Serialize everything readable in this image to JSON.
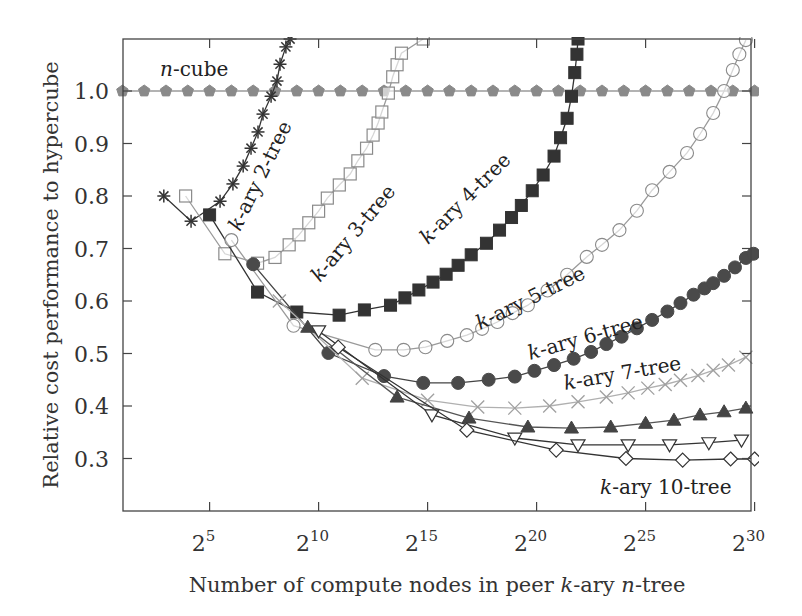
{
  "chart_data": {
    "type": "line",
    "title": "",
    "xlabel": "Number of compute nodes in peer k-ary n-tree",
    "ylabel": "Relative cost performance to hypercube",
    "x_scale": "log2",
    "xlim_log2": [
      1,
      30
    ],
    "ylim": [
      0.2,
      1.1
    ],
    "x_ticks": [
      {
        "exp": 5,
        "label": "2",
        "sup": "5"
      },
      {
        "exp": 10,
        "label": "2",
        "sup": "10"
      },
      {
        "exp": 15,
        "label": "2",
        "sup": "15"
      },
      {
        "exp": 20,
        "label": "2",
        "sup": "20"
      },
      {
        "exp": 25,
        "label": "2",
        "sup": "25"
      },
      {
        "exp": 30,
        "label": "2",
        "sup": "30"
      }
    ],
    "y_ticks": [
      {
        "value": 0.3,
        "label": "0.3"
      },
      {
        "value": 0.4,
        "label": "0.4"
      },
      {
        "value": 0.5,
        "label": "0.5"
      },
      {
        "value": 0.6,
        "label": "0.6"
      },
      {
        "value": 0.7,
        "label": "0.7"
      },
      {
        "value": 0.8,
        "label": "0.8"
      },
      {
        "value": 0.9,
        "label": "0.9"
      },
      {
        "value": 1.0,
        "label": "1.0"
      }
    ],
    "grid": false,
    "legend": "inline labels",
    "series": [
      {
        "name": "n-cube",
        "marker": "pentagon-filled",
        "color": "#8a8a8a",
        "line_color": "#9a9a9a",
        "points": [
          [
            1,
            1.0
          ],
          [
            2,
            1.0
          ],
          [
            3,
            1.0
          ],
          [
            4,
            1.0
          ],
          [
            5,
            1.0
          ],
          [
            6,
            1.0
          ],
          [
            7,
            1.0
          ],
          [
            8,
            1.0
          ],
          [
            9,
            1.0
          ],
          [
            10,
            1.0
          ],
          [
            11,
            1.0
          ],
          [
            12,
            1.0
          ],
          [
            13,
            1.0
          ],
          [
            14,
            1.0
          ],
          [
            15,
            1.0
          ],
          [
            16,
            1.0
          ],
          [
            17,
            1.0
          ],
          [
            18,
            1.0
          ],
          [
            19,
            1.0
          ],
          [
            20,
            1.0
          ],
          [
            21,
            1.0
          ],
          [
            22,
            1.0
          ],
          [
            23,
            1.0
          ],
          [
            24,
            1.0
          ],
          [
            25,
            1.0
          ],
          [
            26,
            1.0
          ],
          [
            27,
            1.0
          ],
          [
            28,
            1.0
          ],
          [
            29,
            1.0
          ],
          [
            30,
            1.0
          ]
        ]
      },
      {
        "name": "k-ary 2-tree",
        "marker": "asterisk",
        "color": "#333333",
        "line_color": "#333333",
        "points": [
          [
            2.9,
            0.8
          ],
          [
            4.15,
            0.752
          ],
          [
            5.48,
            0.79
          ],
          [
            6.07,
            0.823
          ],
          [
            6.54,
            0.857
          ],
          [
            6.9,
            0.891
          ],
          [
            7.22,
            0.922
          ],
          [
            7.45,
            0.956
          ],
          [
            7.82,
            0.99
          ],
          [
            8.09,
            1.019
          ],
          [
            8.23,
            1.051
          ],
          [
            8.5,
            1.084
          ],
          [
            8.69,
            1.099
          ]
        ]
      },
      {
        "name": "k-ary 3-tree",
        "marker": "square-open",
        "color": "#8a8a8a",
        "line_color": "#9a9a9a",
        "points": [
          [
            3.9,
            0.8
          ],
          [
            5.7,
            0.69
          ],
          [
            7.2,
            0.672
          ],
          [
            8.0,
            0.683
          ],
          [
            8.65,
            0.707
          ],
          [
            9.1,
            0.726
          ],
          [
            9.55,
            0.749
          ],
          [
            10.0,
            0.771
          ],
          [
            10.4,
            0.796
          ],
          [
            10.95,
            0.821
          ],
          [
            11.45,
            0.842
          ],
          [
            11.8,
            0.867
          ],
          [
            12.2,
            0.891
          ],
          [
            12.5,
            0.916
          ],
          [
            12.73,
            0.939
          ],
          [
            12.9,
            0.96
          ],
          [
            13.2,
            0.996
          ],
          [
            13.4,
            1.027
          ],
          [
            13.6,
            1.05
          ],
          [
            13.8,
            1.072
          ],
          [
            14.8,
            1.099
          ]
        ]
      },
      {
        "name": "k-ary 4-tree",
        "marker": "square-filled",
        "color": "#333333",
        "line_color": "#333333",
        "points": [
          [
            5.0,
            0.764
          ],
          [
            7.2,
            0.617
          ],
          [
            9.0,
            0.579
          ],
          [
            10.94,
            0.573
          ],
          [
            12.1,
            0.583
          ],
          [
            13.3,
            0.592
          ],
          [
            13.96,
            0.606
          ],
          [
            14.6,
            0.621
          ],
          [
            15.25,
            0.636
          ],
          [
            15.85,
            0.651
          ],
          [
            16.4,
            0.668
          ],
          [
            17.0,
            0.688
          ],
          [
            17.7,
            0.71
          ],
          [
            18.3,
            0.735
          ],
          [
            18.85,
            0.759
          ],
          [
            19.3,
            0.782
          ],
          [
            19.8,
            0.81
          ],
          [
            20.3,
            0.84
          ],
          [
            20.8,
            0.876
          ],
          [
            21.1,
            0.911
          ],
          [
            21.4,
            0.948
          ],
          [
            21.6,
            0.99
          ],
          [
            21.75,
            1.035
          ],
          [
            21.85,
            1.07
          ],
          [
            21.9,
            1.099
          ]
        ]
      },
      {
        "name": "k-ary 5-tree",
        "marker": "circle-open",
        "color": "#8a8a8a",
        "line_color": "#9a9a9a",
        "points": [
          [
            6.0,
            0.716
          ],
          [
            8.85,
            0.553
          ],
          [
            12.6,
            0.507
          ],
          [
            13.9,
            0.507
          ],
          [
            14.9,
            0.512
          ],
          [
            15.9,
            0.524
          ],
          [
            16.8,
            0.535
          ],
          [
            17.5,
            0.547
          ],
          [
            18.2,
            0.56
          ],
          [
            18.9,
            0.577
          ],
          [
            19.6,
            0.592
          ],
          [
            20.5,
            0.62
          ],
          [
            21.4,
            0.65
          ],
          [
            22.3,
            0.684
          ],
          [
            23.0,
            0.707
          ],
          [
            23.8,
            0.735
          ],
          [
            24.6,
            0.772
          ],
          [
            25.3,
            0.811
          ],
          [
            26.1,
            0.846
          ],
          [
            26.9,
            0.882
          ],
          [
            27.5,
            0.918
          ],
          [
            28.1,
            0.958
          ],
          [
            28.6,
            1.0
          ],
          [
            29.0,
            1.04
          ],
          [
            29.3,
            1.07
          ],
          [
            29.6,
            1.097
          ]
        ]
      },
      {
        "name": "k-ary 6-tree",
        "marker": "circle-filled",
        "color": "#4a4a4a",
        "line_color": "#444444",
        "points": [
          [
            7.0,
            0.67
          ],
          [
            10.45,
            0.501
          ],
          [
            13.0,
            0.457
          ],
          [
            14.8,
            0.444
          ],
          [
            16.4,
            0.444
          ],
          [
            17.8,
            0.45
          ],
          [
            19.0,
            0.456
          ],
          [
            19.9,
            0.467
          ],
          [
            20.8,
            0.478
          ],
          [
            21.7,
            0.49
          ],
          [
            22.5,
            0.503
          ],
          [
            23.2,
            0.518
          ],
          [
            23.9,
            0.532
          ],
          [
            24.6,
            0.548
          ],
          [
            25.3,
            0.564
          ],
          [
            26.0,
            0.58
          ],
          [
            26.6,
            0.596
          ],
          [
            27.2,
            0.612
          ],
          [
            27.7,
            0.624
          ],
          [
            28.1,
            0.634
          ],
          [
            28.6,
            0.648
          ],
          [
            29.1,
            0.664
          ],
          [
            29.6,
            0.682
          ],
          [
            29.95,
            0.69
          ]
        ]
      },
      {
        "name": "k-ary 7-tree",
        "marker": "cross",
        "color": "#a0a0a0",
        "line_color": "#b0b0b0",
        "points": [
          [
            8.2,
            0.6
          ],
          [
            12.0,
            0.453
          ],
          [
            15.0,
            0.411
          ],
          [
            17.3,
            0.398
          ],
          [
            19.0,
            0.396
          ],
          [
            20.6,
            0.4
          ],
          [
            21.9,
            0.408
          ],
          [
            23.2,
            0.417
          ],
          [
            24.2,
            0.425
          ],
          [
            25.1,
            0.434
          ],
          [
            25.9,
            0.441
          ],
          [
            26.6,
            0.449
          ],
          [
            27.4,
            0.458
          ],
          [
            28.1,
            0.468
          ],
          [
            28.8,
            0.478
          ],
          [
            29.6,
            0.493
          ]
        ]
      },
      {
        "name": "k-ary 8-tree",
        "marker": "triangle-up-filled",
        "color": "#444444",
        "line_color": "#555555",
        "points": [
          [
            9.5,
            0.55
          ],
          [
            13.6,
            0.417
          ],
          [
            16.9,
            0.377
          ],
          [
            19.6,
            0.36
          ],
          [
            21.6,
            0.358
          ],
          [
            23.4,
            0.36
          ],
          [
            25.0,
            0.367
          ],
          [
            26.3,
            0.373
          ],
          [
            27.5,
            0.383
          ],
          [
            28.6,
            0.389
          ],
          [
            29.6,
            0.396
          ]
        ]
      },
      {
        "name": "k-ary 9-tree",
        "marker": "triangle-down-open",
        "color": "#333333",
        "line_color": "#333333",
        "points": [
          [
            10.0,
            0.543
          ],
          [
            15.2,
            0.383
          ],
          [
            19.0,
            0.339
          ],
          [
            21.9,
            0.326
          ],
          [
            24.2,
            0.326
          ],
          [
            26.1,
            0.326
          ],
          [
            27.9,
            0.33
          ],
          [
            29.4,
            0.335
          ]
        ]
      },
      {
        "name": "k-ary 10-tree",
        "marker": "diamond-open",
        "color": "#333333",
        "line_color": "#333333",
        "points": [
          [
            10.9,
            0.512
          ],
          [
            16.8,
            0.354
          ],
          [
            20.9,
            0.316
          ],
          [
            24.1,
            0.3
          ],
          [
            26.7,
            0.297
          ],
          [
            28.9,
            0.299
          ],
          [
            30.0,
            0.299
          ]
        ]
      }
    ],
    "annotations": [
      {
        "text_italic": "n",
        "text": "-cube",
        "x": 160,
        "y": 76,
        "rotate": 0
      },
      {
        "text_italic": "k",
        "text": "-ary 2-tree",
        "x": 240,
        "y": 232,
        "rotate": -64
      },
      {
        "text_italic": "k",
        "text": "-ary 3-tree",
        "x": 320,
        "y": 283,
        "rotate": -50
      },
      {
        "text_italic": "k",
        "text": "-ary 4-tree",
        "x": 428,
        "y": 245,
        "rotate": -45
      },
      {
        "text_italic": "k",
        "text": "-ary 5-tree",
        "x": 480,
        "y": 330,
        "rotate": -26
      },
      {
        "text_italic": "k",
        "text": "-ary 6-tree",
        "x": 530,
        "y": 360,
        "rotate": -16
      },
      {
        "text_italic": "k",
        "text": "-ary 7-tree",
        "x": 565,
        "y": 390,
        "rotate": -10
      },
      {
        "text_italic": "k",
        "text": "-ary 10-tree",
        "x": 600,
        "y": 494,
        "rotate": 0
      }
    ]
  }
}
